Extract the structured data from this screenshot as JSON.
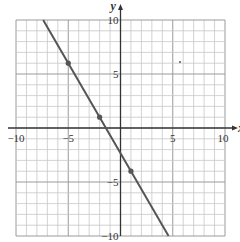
{
  "chart_data": {
    "type": "line",
    "title": "",
    "xlabel": "x",
    "ylabel": "y",
    "xlim": [
      -10,
      10
    ],
    "ylim": [
      -10,
      10
    ],
    "grid": true,
    "grid_step": 1,
    "x_ticks": [
      -10,
      -5,
      5,
      10
    ],
    "y_ticks": [
      10,
      5,
      -5,
      -10
    ],
    "x_tick_labels": [
      "−10",
      "−5",
      "5",
      "10"
    ],
    "y_tick_labels": [
      "10",
      "5",
      "−5",
      "−10"
    ],
    "series": [
      {
        "name": "line",
        "slope": -1.6667,
        "intercept": -2.3333,
        "x_range": [
          -7.4,
          4.6
        ],
        "points": [
          {
            "x": -5,
            "y": 6
          },
          {
            "x": -2,
            "y": 1
          },
          {
            "x": 1,
            "y": -4
          }
        ]
      }
    ],
    "colors": {
      "line": "#555555",
      "grid": "#c8c8c8",
      "axis": "#333333",
      "point": "#555555"
    }
  }
}
